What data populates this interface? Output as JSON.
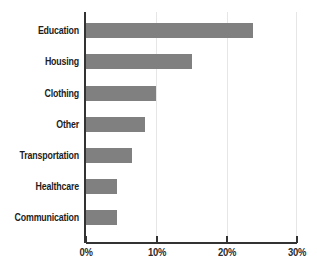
{
  "chart_data": {
    "type": "bar",
    "orientation": "horizontal",
    "title": "",
    "subtitle": "",
    "xlabel": "",
    "ylabel": "",
    "categories": [
      "Education",
      "Housing",
      "Clothing",
      "Other",
      "Transportation",
      "Healthcare",
      "Communication"
    ],
    "values": [
      23.8,
      15.0,
      10.0,
      8.4,
      6.5,
      4.4,
      4.4
    ],
    "value_suffix": "%",
    "xlim": [
      0,
      30
    ],
    "xticks": [
      0,
      10,
      20,
      30
    ],
    "xtick_labels": [
      "0%",
      "10%",
      "20%",
      "30%"
    ],
    "grid": "vertical-light",
    "legend": "none",
    "series": [
      {
        "name": "Share of spending",
        "color": "#808080",
        "values": [
          23.8,
          15.0,
          10.0,
          8.4,
          6.5,
          4.4,
          4.4
        ]
      }
    ]
  },
  "colors": {
    "bar": "#808080",
    "axis": "#333333",
    "gridline": "#e6e6e6",
    "label_text": "#1d1d1d",
    "tick_text": "#2b2b2b",
    "background": "#ffffff"
  }
}
